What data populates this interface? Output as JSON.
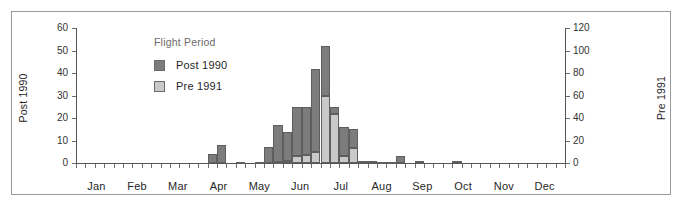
{
  "chart_data": {
    "type": "bar",
    "title": "",
    "subtitle": "",
    "xlabel": "",
    "ylabel": "Post 1990",
    "y2label": "Pre 1991",
    "grid": false,
    "legend_position": "inside-top-left",
    "legend_title": "Flight Period",
    "ylim": [
      0,
      60
    ],
    "yticks": [
      0,
      10,
      20,
      30,
      40,
      50,
      60
    ],
    "y2lim": [
      0,
      120
    ],
    "y2ticks": [
      0,
      20,
      40,
      60,
      80,
      100,
      120
    ],
    "xticks_major": [
      "Jan",
      "Feb",
      "Mar",
      "Apr",
      "May",
      "Jun",
      "Jul",
      "Aug",
      "Sep",
      "Oct",
      "Nov",
      "Dec"
    ],
    "x_note": "weekly bins across the year; values are counts per week",
    "series": [
      {
        "name": "Post 1990",
        "axis": "left",
        "color": "#7c7c7c",
        "values": [
          0,
          0,
          0,
          0,
          0,
          0,
          0,
          0,
          0,
          0,
          0,
          0,
          0,
          0,
          4,
          8,
          0,
          0.5,
          0,
          0.5,
          7,
          17,
          14,
          25,
          25,
          42,
          52,
          25,
          16,
          15,
          1,
          1,
          0.3,
          0.3,
          3,
          0,
          1,
          0,
          0,
          0,
          1,
          0,
          0,
          0,
          0,
          0,
          0,
          0,
          0,
          0,
          0,
          0
        ]
      },
      {
        "name": "Pre 1991",
        "axis": "right",
        "color": "#c9c9c9",
        "values": [
          0,
          0,
          0,
          0,
          0,
          0,
          0,
          0,
          0,
          0,
          0,
          0,
          0,
          0,
          0,
          0,
          0,
          0,
          0,
          0,
          0,
          1,
          2,
          6,
          7,
          10,
          60,
          44,
          6,
          13,
          0,
          0,
          0,
          0,
          0,
          0,
          0,
          0,
          0,
          0,
          0,
          0,
          0,
          0,
          0,
          0,
          0,
          0,
          0,
          0,
          0
        ]
      }
    ]
  },
  "legend": {
    "title": "Flight Period",
    "entries": [
      {
        "label": "Post 1990",
        "color": "#7c7c7c"
      },
      {
        "label": "Pre 1991",
        "color": "#c9c9c9"
      }
    ]
  },
  "axes": {
    "left": {
      "title": "Post 1990",
      "ticks": [
        "60",
        "50",
        "40",
        "30",
        "20",
        "10",
        "0"
      ]
    },
    "right": {
      "title": "Pre 1991",
      "ticks": [
        "120",
        "100",
        "80",
        "60",
        "40",
        "20",
        "0"
      ]
    },
    "bottom": {
      "ticks": [
        "Jan",
        "Feb",
        "Mar",
        "Apr",
        "May",
        "Jun",
        "Jul",
        "Aug",
        "Sep",
        "Oct",
        "Nov",
        "Dec"
      ]
    }
  }
}
